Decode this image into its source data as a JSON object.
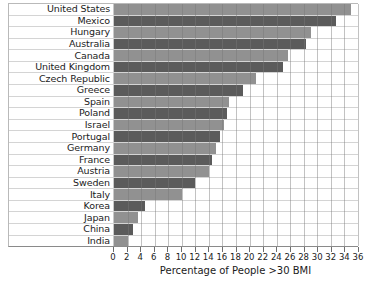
{
  "chart_data": {
    "type": "bar",
    "orientation": "horizontal",
    "title": "",
    "xlabel": "Percentage of People >30 BMI",
    "ylabel": "",
    "xlim": [
      0,
      36
    ],
    "xticks": [
      0,
      2,
      4,
      6,
      8,
      10,
      12,
      14,
      16,
      18,
      20,
      22,
      24,
      26,
      28,
      30,
      32,
      34,
      36
    ],
    "grid": true,
    "legend": "none",
    "categories": [
      "United States",
      "Mexico",
      "Hungary",
      "Australia",
      "Canada",
      "United Kingdom",
      "Czech Republic",
      "Greece",
      "Spain",
      "Poland",
      "Israel",
      "Portugal",
      "Germany",
      "France",
      "Austria",
      "Sweden",
      "Italy",
      "Korea",
      "Japan",
      "China",
      "India"
    ],
    "values": [
      35.0,
      32.8,
      29.0,
      28.4,
      25.6,
      25.0,
      21.0,
      19.0,
      17.0,
      16.7,
      16.2,
      15.6,
      15.0,
      14.5,
      14.0,
      12.0,
      10.0,
      4.5,
      3.6,
      2.8,
      2.0
    ],
    "bar_colors": {
      "light": "#919191",
      "dark": "#5b5b5b",
      "alternating": true
    }
  }
}
